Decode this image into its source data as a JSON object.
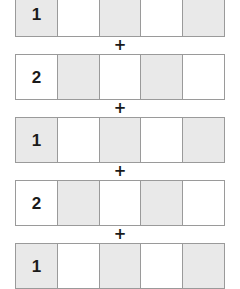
{
  "diagram": {
    "type": "fraction-strip-addition",
    "operator_symbol": "+",
    "cell_count_per_strip": 5,
    "colors": {
      "shaded_cell": "#e9e9e9",
      "unshaded_cell": "#ffffff",
      "cell_border": "#9a9a9a",
      "text": "#1a1a1a",
      "background": "#ffffff"
    },
    "strips": [
      {
        "label": "1",
        "cells": [
          {
            "value": "1",
            "shaded": true
          },
          {
            "value": "",
            "shaded": false
          },
          {
            "value": "",
            "shaded": true
          },
          {
            "value": "",
            "shaded": false
          },
          {
            "value": "",
            "shaded": true
          }
        ]
      },
      {
        "label": "2",
        "cells": [
          {
            "value": "2",
            "shaded": false
          },
          {
            "value": "",
            "shaded": true
          },
          {
            "value": "",
            "shaded": false
          },
          {
            "value": "",
            "shaded": true
          },
          {
            "value": "",
            "shaded": false
          }
        ]
      },
      {
        "label": "1",
        "cells": [
          {
            "value": "1",
            "shaded": true
          },
          {
            "value": "",
            "shaded": false
          },
          {
            "value": "",
            "shaded": true
          },
          {
            "value": "",
            "shaded": false
          },
          {
            "value": "",
            "shaded": true
          }
        ]
      },
      {
        "label": "2",
        "cells": [
          {
            "value": "2",
            "shaded": false
          },
          {
            "value": "",
            "shaded": true
          },
          {
            "value": "",
            "shaded": false
          },
          {
            "value": "",
            "shaded": true
          },
          {
            "value": "",
            "shaded": false
          }
        ]
      },
      {
        "label": "1",
        "cells": [
          {
            "value": "1",
            "shaded": true
          },
          {
            "value": "",
            "shaded": false
          },
          {
            "value": "",
            "shaded": true
          },
          {
            "value": "",
            "shaded": false
          },
          {
            "value": "",
            "shaded": true
          }
        ]
      }
    ]
  }
}
